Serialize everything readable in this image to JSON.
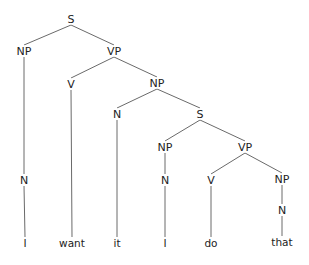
{
  "diagram": {
    "type": "syntax-tree",
    "sentence": "I want it I do that",
    "nodes": [
      {
        "id": "s1",
        "label": "S",
        "x": 71,
        "y": 19
      },
      {
        "id": "np1",
        "label": "NP",
        "x": 24,
        "y": 51
      },
      {
        "id": "vp1",
        "label": "VP",
        "x": 114,
        "y": 51
      },
      {
        "id": "v1",
        "label": "V",
        "x": 71,
        "y": 84
      },
      {
        "id": "np2",
        "label": "NP",
        "x": 157,
        "y": 83
      },
      {
        "id": "n2",
        "label": "N",
        "x": 117,
        "y": 114
      },
      {
        "id": "s2",
        "label": "S",
        "x": 200,
        "y": 114
      },
      {
        "id": "np3",
        "label": "NP",
        "x": 165,
        "y": 147
      },
      {
        "id": "vp2",
        "label": "VP",
        "x": 245,
        "y": 147
      },
      {
        "id": "n1",
        "label": "N",
        "x": 24,
        "y": 180
      },
      {
        "id": "n3",
        "label": "N",
        "x": 165,
        "y": 180
      },
      {
        "id": "v2",
        "label": "V",
        "x": 211,
        "y": 180
      },
      {
        "id": "np4",
        "label": "NP",
        "x": 282,
        "y": 179
      },
      {
        "id": "n4",
        "label": "N",
        "x": 282,
        "y": 210
      },
      {
        "id": "w1",
        "label": "I",
        "x": 25,
        "y": 243,
        "word": true
      },
      {
        "id": "w2",
        "label": "want",
        "x": 72,
        "y": 243,
        "word": true
      },
      {
        "id": "w3",
        "label": "it",
        "x": 117,
        "y": 243,
        "word": true
      },
      {
        "id": "w4",
        "label": "I",
        "x": 165,
        "y": 243,
        "word": true
      },
      {
        "id": "w5",
        "label": "do",
        "x": 211,
        "y": 243,
        "word": true
      },
      {
        "id": "w6",
        "label": "that",
        "x": 282,
        "y": 242,
        "word": true
      }
    ],
    "edges": [
      [
        "s1",
        "np1"
      ],
      [
        "s1",
        "vp1"
      ],
      [
        "np1",
        "n1"
      ],
      [
        "n1",
        "w1"
      ],
      [
        "vp1",
        "v1"
      ],
      [
        "vp1",
        "np2"
      ],
      [
        "v1",
        "w2"
      ],
      [
        "np2",
        "n2"
      ],
      [
        "np2",
        "s2"
      ],
      [
        "n2",
        "w3"
      ],
      [
        "s2",
        "np3"
      ],
      [
        "s2",
        "vp2"
      ],
      [
        "np3",
        "n3"
      ],
      [
        "n3",
        "w4"
      ],
      [
        "vp2",
        "v2"
      ],
      [
        "vp2",
        "np4"
      ],
      [
        "v2",
        "w5"
      ],
      [
        "np4",
        "n4"
      ],
      [
        "n4",
        "w6"
      ]
    ]
  }
}
